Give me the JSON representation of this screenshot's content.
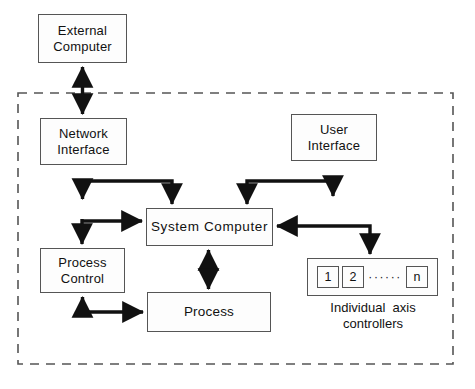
{
  "diagram": {
    "boundary": {
      "name": "system-boundary",
      "style": "dashed",
      "color": "#555555"
    },
    "nodes": {
      "external_computer": {
        "line1": "External",
        "line2": "Computer"
      },
      "network_interface": {
        "line1": "Network",
        "line2": "Interface"
      },
      "user_interface": {
        "line1": "User",
        "line2": "Interface"
      },
      "system_computer": {
        "line1": "System  Computer",
        "line2": ""
      },
      "process_control": {
        "line1": "Process",
        "line2": "Control"
      },
      "process": {
        "line1": "Process",
        "line2": ""
      }
    },
    "axis_controllers": {
      "cells": [
        "1",
        "2",
        "n"
      ],
      "ellipsis": "······",
      "caption_line1": "Individual  axis",
      "caption_line2": "controllers"
    },
    "connections": [
      {
        "name": "external-computer-to-network-interface",
        "from": "external_computer",
        "to": "network_interface",
        "direction": "bidirectional",
        "shape": "vertical"
      },
      {
        "name": "network-interface-to-system-computer",
        "from": "network_interface",
        "to": "system_computer",
        "direction": "bidirectional",
        "shape": "elbow"
      },
      {
        "name": "user-interface-to-system-computer",
        "from": "user_interface",
        "to": "system_computer",
        "direction": "bidirectional",
        "shape": "elbow"
      },
      {
        "name": "system-computer-to-axis-controllers",
        "from": "system_computer",
        "to": "axis_controllers",
        "direction": "bidirectional",
        "shape": "elbow"
      },
      {
        "name": "system-computer-to-process",
        "from": "system_computer",
        "to": "process",
        "direction": "bidirectional",
        "shape": "vertical"
      },
      {
        "name": "process-control-to-system-computer",
        "from": "process_control",
        "to": "system_computer",
        "direction": "unidirectional",
        "shape": "elbow"
      },
      {
        "name": "process-control-to-process",
        "from": "process_control",
        "to": "process",
        "direction": "bidirectional",
        "shape": "elbow"
      }
    ],
    "colors": {
      "stroke": "#111111",
      "box_border": "#555555",
      "boundary": "#555555",
      "background": "#ffffff",
      "text": "#111111"
    }
  }
}
